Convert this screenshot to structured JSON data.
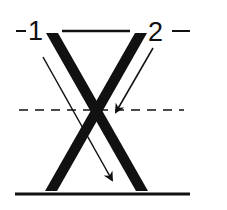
{
  "diagram": {
    "labels": {
      "label_1": "1",
      "label_2": "2"
    },
    "colors": {
      "ink": "#111111",
      "background": "#ffffff"
    },
    "elements": {
      "top_bar": "horizontal line between labels 1 and 2",
      "left_leg": "thick diagonal bar from top-left to bottom-right",
      "right_leg": "thick diagonal bar from top-right to bottom-left",
      "dashed_line": "horizontal dashed line through crossing point",
      "baseline": "thick horizontal ground line",
      "arrow_1": "thin arrow from near label 1 pointing down-right",
      "arrow_2": "thin arrow from near label 2 pointing down-left to crossing"
    }
  }
}
